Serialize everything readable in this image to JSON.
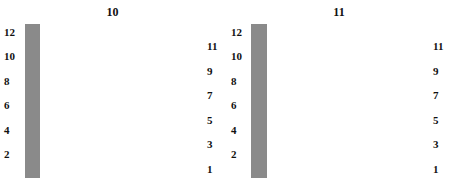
{
  "legend_symbols": {
    ".": "knit (blank)",
    "G": "no stitch (grey)",
    "O": "yarn over",
    "L": "left-leaning decrease",
    "R": "right-leaning decrease",
    "/": "right slant",
    "\\": "left slant",
    "A": "central double decrease"
  },
  "charts": [
    {
      "title": "10",
      "columns": 14,
      "left_row_numbers": [
        "12",
        "10",
        "8",
        "6",
        "4",
        "2"
      ],
      "right_row_numbers": [
        "11",
        "9",
        "7",
        "5",
        "3",
        "1"
      ],
      "rows_top_to_bottom": [
        ". L O . . G G G G . . O R .",
        ". L O . . G G G G . . O R .",
        "G . L O . . G G G . . O R G",
        "G . L O . . G G G . . O R G",
        "G G . L O . . G . . O R G G",
        "G G . L O . . G . . O R G G",
        "G G G . L O . . O R . G G G",
        "G G G . L O . . O R . G G G",
        "G G G G . L O . O R . G G G",
        "G G G G . L O . O R . G G G",
        "G G G G G . L O . . G G G G",
        "G G G G G . L O . . G G G G"
      ]
    },
    {
      "title": "11",
      "columns": 15,
      "left_row_numbers": [
        "12",
        "10",
        "8",
        "6",
        "4",
        "2"
      ],
      "right_row_numbers": [
        "11",
        "9",
        "7",
        "5",
        "3",
        "1"
      ],
      "rows_top_to_bottom": [
        ". . . . . . L O . . . . . . .",
        ". . . . . . L O . . . . . . .",
        ". . . . . . O A O . . . . . .",
        ". . . . . . O A O . . . . . .",
        ". . . . . O / A \\ O . . . . .",
        ". . . . . O / A \\ O . . . . .",
        ". . . . O / / A \\ \\ O . . . .",
        ". . . . O / / A \\ \\ O . . . .",
        ". . . O / / / A \\ \\ \\ O . . .",
        ". . . O / / / A \\ \\ \\ O . . .",
        ". . O / / / / A \\ \\ \\ \\ O . .",
        ". . O / / / / A \\ \\ \\ \\ O . ."
      ]
    }
  ],
  "colors": {
    "grey_cell": "#8f8f8f",
    "grid_line": "#8a8a8a",
    "ink": "#111111"
  }
}
